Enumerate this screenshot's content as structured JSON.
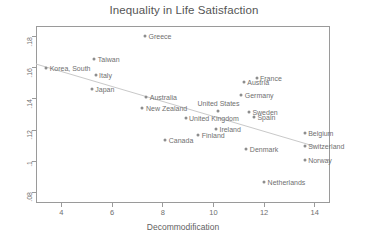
{
  "chart_data": {
    "type": "scatter",
    "title": "Inequality in Life Satisfaction",
    "xlabel": "Decommodification",
    "ylabel": "",
    "xlim": [
      3.0,
      14.6
    ],
    "ylim": [
      0.073,
      0.187
    ],
    "grid": false,
    "legend": "none",
    "xticks": [
      "4",
      "6",
      "8",
      "10",
      "12",
      "14"
    ],
    "xtick_values": [
      4,
      6,
      8,
      10,
      12,
      14
    ],
    "yticks": [
      ".18",
      ".16",
      ".14",
      ".12",
      ".1",
      ".08"
    ],
    "ytick_values": [
      0.18,
      0.16,
      0.14,
      0.12,
      0.1,
      0.08
    ],
    "points": [
      {
        "label": "Greece",
        "x": 7.3,
        "y": 0.1805,
        "label_pos": "right"
      },
      {
        "label": "Taiwan",
        "x": 5.3,
        "y": 0.1655,
        "label_pos": "right"
      },
      {
        "label": "Korea, South",
        "x": 3.4,
        "y": 0.16,
        "label_pos": "right"
      },
      {
        "label": "Italy",
        "x": 5.35,
        "y": 0.1555,
        "label_pos": "right"
      },
      {
        "label": "France",
        "x": 11.7,
        "y": 0.1535,
        "label_pos": "right"
      },
      {
        "label": "Austria",
        "x": 11.2,
        "y": 0.151,
        "label_pos": "right"
      },
      {
        "label": "Japan",
        "x": 5.2,
        "y": 0.1465,
        "label_pos": "right"
      },
      {
        "label": "Germany",
        "x": 11.1,
        "y": 0.1425,
        "label_pos": "right"
      },
      {
        "label": "Australia",
        "x": 7.35,
        "y": 0.1415,
        "label_pos": "right"
      },
      {
        "label": "New Zealand",
        "x": 7.2,
        "y": 0.1345,
        "label_pos": "right"
      },
      {
        "label": "United States",
        "x": 10.2,
        "y": 0.1325,
        "label_pos": "above"
      },
      {
        "label": "Sweden",
        "x": 11.4,
        "y": 0.1315,
        "label_pos": "right"
      },
      {
        "label": "Spain",
        "x": 11.6,
        "y": 0.1285,
        "label_pos": "right"
      },
      {
        "label": "United Kingdom",
        "x": 8.9,
        "y": 0.1275,
        "label_pos": "right"
      },
      {
        "label": "Ireland",
        "x": 10.1,
        "y": 0.1205,
        "label_pos": "right"
      },
      {
        "label": "Belgium",
        "x": 13.6,
        "y": 0.118,
        "label_pos": "right"
      },
      {
        "label": "Finland",
        "x": 9.4,
        "y": 0.1165,
        "label_pos": "right"
      },
      {
        "label": "Canada",
        "x": 8.1,
        "y": 0.1135,
        "label_pos": "right"
      },
      {
        "label": "Switzerland",
        "x": 13.6,
        "y": 0.1095,
        "label_pos": "right"
      },
      {
        "label": "Denmark",
        "x": 11.3,
        "y": 0.108,
        "label_pos": "right"
      },
      {
        "label": "Norway",
        "x": 13.6,
        "y": 0.1005,
        "label_pos": "right"
      },
      {
        "label": "Netherlands",
        "x": 12.0,
        "y": 0.0865,
        "label_pos": "right"
      }
    ],
    "fit_line": {
      "name": "linear-fit",
      "x0": 3.0,
      "y0": 0.1625,
      "x1": 14.0,
      "y1": 0.1095
    },
    "colors": {
      "marker": "#8d8d8d",
      "label_text": "#6f6f6f",
      "title_text": "#555555",
      "axis": "#9a9a9a",
      "fit_line": "#c9c9c9",
      "background": "#ffffff"
    }
  }
}
